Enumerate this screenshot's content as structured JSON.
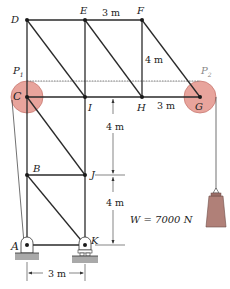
{
  "diagram": {
    "type": "truss with pulleys",
    "colors": {
      "member": "#2a2a2a",
      "pulley_fill": "#e8a49c",
      "pulley_stroke": "#c97a72",
      "weight_fill": "#b08078",
      "ground_fill": "#a9a9a9",
      "dashed": "#555555"
    },
    "joints": {
      "A": "A",
      "B": "B",
      "C": "C",
      "D": "D",
      "E": "E",
      "F": "F",
      "G": "G",
      "H": "H",
      "I": "I",
      "J": "J",
      "K": "K"
    },
    "pulleys": {
      "p1": "P",
      "p1_sub": "1",
      "p2": "P",
      "p2_sub": "2"
    },
    "dimensions": {
      "ef": "3 m",
      "fh": "4 m",
      "hg": "3 m",
      "ij": "4 m",
      "jk": "4 m",
      "ak": "3 m"
    },
    "load": {
      "label": "W = 7000 N"
    }
  }
}
